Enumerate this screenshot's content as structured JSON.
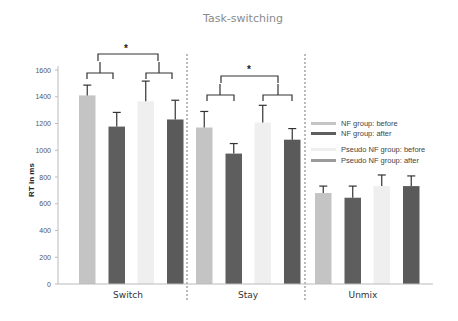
{
  "chart_data": {
    "type": "bar",
    "title": "Task-switching",
    "xlabel": "",
    "ylabel": "RT in ms",
    "ylim": [
      0,
      1600
    ],
    "yticks": [
      0,
      200,
      400,
      600,
      800,
      1000,
      1200,
      1400,
      1600
    ],
    "grid": false,
    "legend_position": "right",
    "categories": [
      "Switch",
      "Stay",
      "Unmix"
    ],
    "series": [
      {
        "name": "NF group: before",
        "color": "#c4c4c4",
        "values": [
          1410,
          1170,
          680
        ],
        "error_upper": [
          1487,
          1290,
          732
        ]
      },
      {
        "name": "NF group: after",
        "color": "#5e5e5e",
        "values": [
          1177,
          975,
          645
        ],
        "error_upper": [
          1283,
          1050,
          732
        ]
      },
      {
        "name": "Pseudo NF group: before",
        "color": "#efefef",
        "values": [
          1366,
          1207,
          732
        ],
        "error_upper": [
          1517,
          1336,
          815
        ]
      },
      {
        "name": "Pseudo NF group: after",
        "color": "#5a5a5a",
        "values": [
          1230,
          1079,
          732
        ],
        "error_upper": [
          1374,
          1162,
          808
        ]
      }
    ],
    "annotations": [
      {
        "category": "Switch",
        "text": "*",
        "type": "significance-bracket"
      },
      {
        "category": "Stay",
        "text": "*",
        "type": "significance-bracket"
      }
    ]
  }
}
